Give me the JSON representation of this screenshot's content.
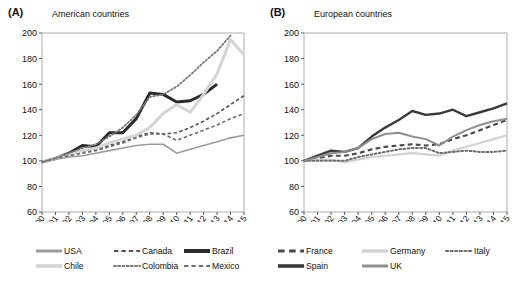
{
  "figure": {
    "background": "#ffffff",
    "panels": [
      {
        "letter": "(A)",
        "title": "American countries"
      },
      {
        "letter": "(B)",
        "title": "European countries"
      }
    ]
  },
  "chart_data": [
    {
      "type": "line",
      "panel": "(A)",
      "title": "American countries",
      "xlabel": "",
      "ylabel": "",
      "xlim": [
        2000,
        2015
      ],
      "ylim": [
        60,
        200
      ],
      "yticks": [
        60,
        80,
        100,
        120,
        140,
        160,
        180,
        200
      ],
      "grid": false,
      "legend_position": "below",
      "x": [
        2000,
        2001,
        2002,
        2003,
        2004,
        2005,
        2006,
        2007,
        2008,
        2009,
        2010,
        2011,
        2012,
        2013,
        2014,
        2015
      ],
      "series": [
        {
          "name": "USA",
          "style": "solid",
          "color": "#9b9b9b",
          "width": 1.6,
          "values": [
            99,
            101,
            103,
            104,
            106,
            108,
            110,
            112,
            113,
            113,
            106,
            109,
            112,
            115,
            118,
            120
          ]
        },
        {
          "name": "Canada",
          "style": "dashed",
          "color": "#555555",
          "width": 1.6,
          "values": [
            99,
            102,
            105,
            107,
            109,
            112,
            115,
            119,
            122,
            121,
            122,
            126,
            131,
            137,
            144,
            151
          ]
        },
        {
          "name": "Brazil",
          "style": "solid",
          "color": "#2b2b2b",
          "width": 3.0,
          "values": [
            99,
            102,
            106,
            112,
            111,
            122,
            122,
            133,
            153,
            152,
            146,
            147,
            152,
            160,
            null,
            null
          ]
        },
        {
          "name": "Chile",
          "style": "solid",
          "color": "#d4d4d4",
          "width": 3.0,
          "values": [
            99,
            102,
            105,
            108,
            110,
            114,
            117,
            120,
            126,
            137,
            144,
            138,
            152,
            168,
            195,
            183
          ]
        },
        {
          "name": "Colombia",
          "style": "dotted",
          "color": "#7a7a7a",
          "width": 1.8,
          "values": [
            99,
            102,
            106,
            110,
            113,
            119,
            126,
            136,
            150,
            152,
            158,
            167,
            177,
            186,
            198,
            null
          ]
        },
        {
          "name": "Mexico",
          "style": "dashed",
          "color": "#6e6e6e",
          "width": 1.6,
          "values": [
            99,
            102,
            104,
            106,
            108,
            111,
            114,
            118,
            121,
            121,
            116,
            120,
            124,
            128,
            133,
            137
          ]
        }
      ]
    },
    {
      "type": "line",
      "panel": "(B)",
      "title": "European countries",
      "xlabel": "",
      "ylabel": "",
      "xlim": [
        2000,
        2015
      ],
      "ylim": [
        60,
        200
      ],
      "yticks": [
        60,
        80,
        100,
        120,
        140,
        160,
        180,
        200
      ],
      "grid": false,
      "legend_position": "below",
      "x": [
        2000,
        2001,
        2002,
        2003,
        2004,
        2005,
        2006,
        2007,
        2008,
        2009,
        2010,
        2011,
        2012,
        2013,
        2014,
        2015
      ],
      "series": [
        {
          "name": "France",
          "style": "dashed",
          "color": "#4a4a4a",
          "width": 2.2,
          "values": [
            100,
            102,
            104,
            104,
            106,
            109,
            111,
            112,
            113,
            112,
            113,
            117,
            120,
            124,
            128,
            132
          ]
        },
        {
          "name": "Germany",
          "style": "solid",
          "color": "#d2d2d2",
          "width": 2.2,
          "values": [
            100,
            101,
            101,
            99,
            101,
            103,
            104,
            105,
            106,
            105,
            104,
            108,
            111,
            114,
            117,
            120
          ]
        },
        {
          "name": "Italy",
          "style": "dotted",
          "color": "#6f6f6f",
          "width": 2.0,
          "values": [
            100,
            100,
            100,
            100,
            103,
            105,
            107,
            109,
            110,
            110,
            106,
            107,
            108,
            107,
            107,
            108
          ]
        },
        {
          "name": "Spain",
          "style": "solid",
          "color": "#3a3a3a",
          "width": 2.4,
          "values": [
            100,
            104,
            108,
            107,
            110,
            119,
            126,
            132,
            139,
            136,
            137,
            140,
            135,
            138,
            141,
            145
          ]
        },
        {
          "name": "UK",
          "style": "solid",
          "color": "#8f8f8f",
          "width": 2.0,
          "values": [
            100,
            103,
            106,
            107,
            110,
            117,
            121,
            122,
            119,
            117,
            112,
            119,
            124,
            128,
            131,
            133
          ]
        }
      ]
    }
  ],
  "xtick_labels": [
    "2000",
    "2001",
    "2002",
    "2003",
    "2004",
    "2005",
    "2006",
    "2007",
    "2008",
    "2009",
    "2010",
    "2011",
    "2012",
    "2013",
    "2014",
    "2015"
  ],
  "ytick_labels": [
    "200",
    "180",
    "160",
    "140",
    "120",
    "100",
    "80",
    "60"
  ],
  "legends": {
    "panel_a": [
      {
        "label": "USA",
        "style": "solid",
        "color": "#9b9b9b",
        "width": 3.0
      },
      {
        "label": "Canada",
        "style": "dashed",
        "color": "#555555",
        "width": 2.0
      },
      {
        "label": "Brazil",
        "style": "solid",
        "color": "#2b2b2b",
        "width": 4.0
      },
      {
        "label": "Chile",
        "style": "solid",
        "color": "#d4d4d4",
        "width": 3.6
      },
      {
        "label": "Colombia",
        "style": "dotted",
        "color": "#7a7a7a",
        "width": 2.0
      },
      {
        "label": "Mexico",
        "style": "dashed",
        "color": "#6e6e6e",
        "width": 2.0
      }
    ],
    "panel_b": [
      {
        "label": "France",
        "style": "dashed",
        "color": "#4a4a4a",
        "width": 3.0
      },
      {
        "label": "Germany",
        "style": "solid",
        "color": "#d2d2d2",
        "width": 3.4
      },
      {
        "label": "Italy",
        "style": "dotted",
        "color": "#6f6f6f",
        "width": 2.2
      },
      {
        "label": "Spain",
        "style": "solid",
        "color": "#3a3a3a",
        "width": 3.6
      },
      {
        "label": "UK",
        "style": "solid",
        "color": "#8f8f8f",
        "width": 3.0
      }
    ]
  }
}
